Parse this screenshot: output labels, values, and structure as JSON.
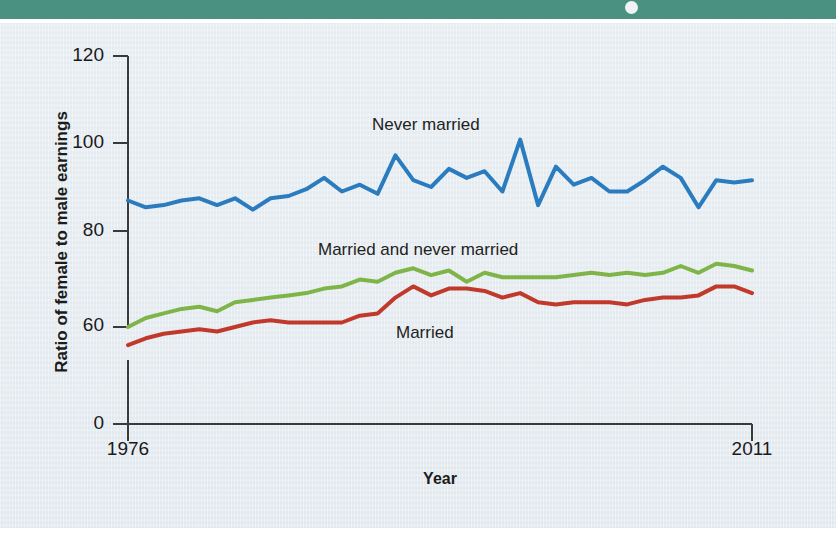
{
  "header": {
    "bar_color": "#4b9181",
    "dot": "bullet-dot"
  },
  "axes": {
    "ylabel": "Ratio of female to male earnings",
    "xlabel": "Year",
    "yticks": [
      "120",
      "100",
      "80",
      "60",
      "0"
    ],
    "ytick_values": [
      120,
      100,
      80,
      60,
      0
    ],
    "xticks": [
      "1976",
      "2011"
    ],
    "axis_break": true
  },
  "labels": {
    "never_married": "Never married",
    "married_and_never_married": "Married and never married",
    "married": "Married"
  },
  "colors": {
    "never_married": "#2b7cbf",
    "married_and_never_married": "#7fb548",
    "married": "#c0392b",
    "background": "#eef2f5",
    "axis": "#3a3a3a"
  },
  "chart_data": {
    "type": "line",
    "title": "",
    "xlabel": "Year",
    "ylabel": "Ratio of female to male earnings",
    "xlim": [
      1976,
      2011
    ],
    "ylim": [
      56,
      120
    ],
    "yticks": [
      60,
      80,
      100,
      120
    ],
    "grid": false,
    "legend": "inline-annotations",
    "x": [
      1976,
      1977,
      1978,
      1979,
      1980,
      1981,
      1982,
      1983,
      1984,
      1985,
      1986,
      1987,
      1988,
      1989,
      1990,
      1991,
      1992,
      1993,
      1994,
      1995,
      1996,
      1997,
      1998,
      1999,
      2000,
      2001,
      2002,
      2003,
      2004,
      2005,
      2006,
      2007,
      2008,
      2009,
      2010,
      2011
    ],
    "series": [
      {
        "name": "Never married",
        "color": "#2b7cbf",
        "values": [
          88.0,
          86.5,
          87.0,
          88.0,
          88.5,
          87.0,
          88.5,
          86.0,
          88.5,
          89.0,
          90.5,
          93.0,
          90.0,
          91.5,
          89.5,
          98.0,
          92.5,
          91.0,
          95.0,
          93.0,
          94.5,
          90.0,
          101.5,
          87.0,
          95.5,
          91.5,
          93.0,
          90.0,
          90.0,
          92.5,
          95.5,
          93.0,
          86.5,
          92.5,
          92.0,
          92.5
        ]
      },
      {
        "name": "Married and never married",
        "color": "#7fb548",
        "values": [
          60.0,
          62.0,
          63.0,
          64.0,
          64.5,
          63.5,
          65.5,
          66.0,
          66.5,
          67.0,
          67.5,
          68.5,
          69.0,
          70.5,
          70.0,
          72.0,
          73.0,
          71.5,
          72.5,
          70.0,
          72.0,
          71.0,
          71.0,
          71.0,
          71.0,
          71.5,
          72.0,
          71.5,
          72.0,
          71.5,
          72.0,
          73.5,
          72.0,
          74.0,
          73.5,
          72.5
        ]
      },
      {
        "name": "Married",
        "color": "#c0392b",
        "values": [
          56.0,
          57.5,
          58.5,
          59.0,
          59.5,
          59.0,
          60.0,
          61.0,
          61.5,
          61.0,
          61.0,
          61.0,
          61.0,
          62.5,
          63.0,
          66.5,
          69.0,
          67.0,
          68.5,
          68.5,
          68.0,
          66.5,
          67.5,
          65.5,
          65.0,
          65.5,
          65.5,
          65.5,
          65.0,
          66.0,
          66.5,
          66.5,
          67.0,
          69.0,
          69.0,
          67.5
        ]
      }
    ]
  }
}
